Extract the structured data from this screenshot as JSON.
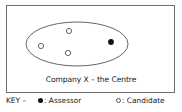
{
  "diagram": {
    "caption": "Company X – the Centre",
    "colors": {
      "frame": "#6e6e6e",
      "ellipse": "#555555",
      "assessor": "#111111",
      "candidate_stroke": "#555555"
    },
    "ellipse": {
      "cx": 77,
      "cy": 44,
      "rx": 51,
      "ry": 22
    },
    "nodes": [
      {
        "type": "candidate",
        "x": 69,
        "y": 31
      },
      {
        "type": "candidate",
        "x": 41,
        "y": 46
      },
      {
        "type": "candidate",
        "x": 68,
        "y": 53
      },
      {
        "type": "assessor",
        "x": 111,
        "y": 42
      }
    ]
  },
  "key": {
    "label": "KEY –",
    "assessor_label": ": Assessor",
    "candidate_label": ": Candidate"
  }
}
